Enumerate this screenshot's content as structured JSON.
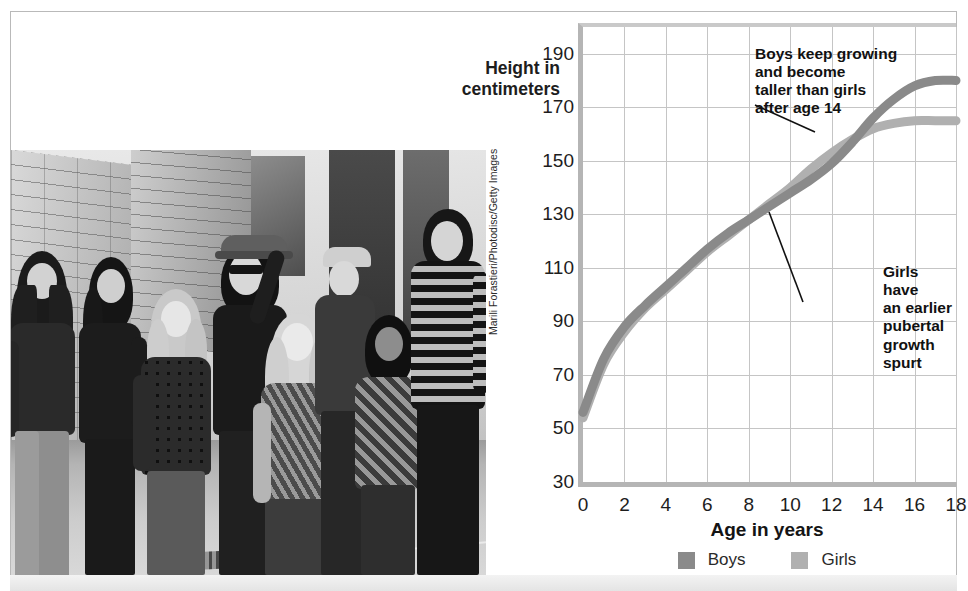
{
  "figure": {
    "photo_credit": "Marili Forastieri/Photodisc/Getty Images",
    "photo_alt": "black-and-white photograph of a group of teenagers of varying heights standing together on a city sidewalk"
  },
  "colors": {
    "boys_line": "#8a8a8a",
    "girls_line": "#b0b0b0",
    "grid": "#c5c5c5",
    "axis": "#b5b5b5",
    "text": "#1d1d1d"
  },
  "chart_data": {
    "type": "line",
    "title": "",
    "xlabel": "Age in years",
    "ylabel": "Height in\ncentimeters",
    "ylabel_line1": "Height in",
    "ylabel_line2": "centimeters",
    "xlim": [
      0,
      18
    ],
    "ylim": [
      30,
      200
    ],
    "grid": true,
    "legend_position": "bottom-center",
    "xticks": [
      0,
      2,
      4,
      6,
      8,
      10,
      12,
      14,
      16,
      18
    ],
    "xtick_labels": [
      "0",
      "2",
      "4",
      "6",
      "8",
      "10",
      "12",
      "14",
      "16",
      "18"
    ],
    "yticks": [
      30,
      50,
      70,
      90,
      110,
      130,
      150,
      170,
      190
    ],
    "ytick_labels": [
      "30",
      "50",
      "70",
      "90",
      "110",
      "130",
      "150",
      "170",
      "190"
    ],
    "x": [
      0,
      1,
      2,
      3,
      4,
      5,
      6,
      7,
      8,
      9,
      10,
      11,
      12,
      13,
      14,
      15,
      16,
      17,
      18
    ],
    "series": [
      {
        "name": "Boys",
        "color": "#8a8a8a",
        "values": [
          56,
          76,
          88,
          96,
          103,
          110,
          117,
          123,
          128,
          133,
          138,
          143,
          149,
          157,
          166,
          173,
          178,
          180,
          180
        ]
      },
      {
        "name": "Girls",
        "color": "#b0b0b0",
        "values": [
          54,
          74,
          86,
          95,
          102,
          109,
          116,
          122,
          128,
          134,
          140,
          147,
          153,
          158,
          162,
          164,
          165,
          165,
          165
        ]
      }
    ],
    "legend": [
      {
        "label": "Boys",
        "color": "#8a8a8a"
      },
      {
        "label": "Girls",
        "color": "#b0b0b0"
      }
    ],
    "annotations": [
      {
        "id": "boys-annotation",
        "text": "Boys keep growing\nand become\ntaller than girls\nafter age 14",
        "points_to_series": "Boys",
        "points_to_age": 15
      },
      {
        "id": "girls-annotation",
        "text": "Girls have\nan earlier\npubertal\ngrowth spurt",
        "points_to_series": "Girls",
        "points_to_age": 11
      }
    ]
  }
}
